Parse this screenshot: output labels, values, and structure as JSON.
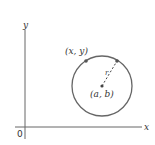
{
  "diagram": {
    "type": "circle-on-coordinate-plane",
    "labels": {
      "origin": "0",
      "x_axis": "x",
      "y_axis": "y",
      "point_on_circle": "(x, y)",
      "center": "(a, b)",
      "radius": "r"
    },
    "colors": {
      "axis": "#555555",
      "circle": "#666666",
      "point": "#555555",
      "text": "#333333"
    }
  }
}
